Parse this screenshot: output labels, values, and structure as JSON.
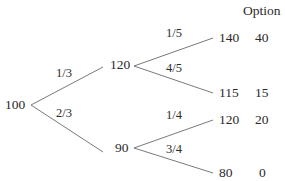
{
  "header": {
    "option_label": "Option"
  },
  "tree": {
    "root": {
      "value": "100"
    },
    "up": {
      "value": "120",
      "prob": "1/3"
    },
    "down": {
      "value": "90",
      "prob": "2/3"
    },
    "leaves": [
      {
        "value": "140",
        "prob": "1/5",
        "option": "40"
      },
      {
        "value": "115",
        "prob": "4/5",
        "option": "15"
      },
      {
        "value": "120",
        "prob": "1/4",
        "option": "20"
      },
      {
        "value": "80",
        "prob": "3/4",
        "option": "0"
      }
    ]
  },
  "colors": {
    "line": "#6a6a6a",
    "text": "#2a2a2a"
  }
}
